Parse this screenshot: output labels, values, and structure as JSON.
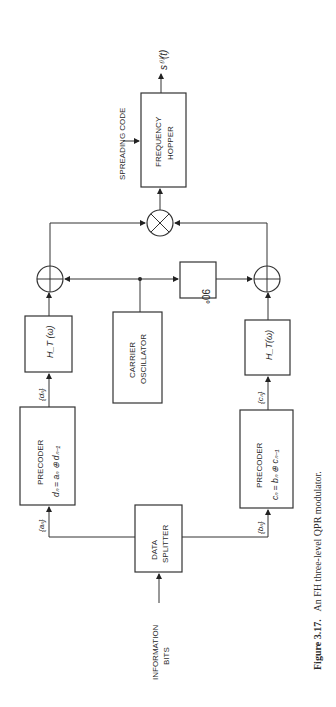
{
  "figure": {
    "caption_number": "Figure 3.17.",
    "caption_text": "An FH three-level QPR modulator."
  },
  "blocks": {
    "frequency_hopper": {
      "line1": "FREQUENCY",
      "line2": "HOPPER"
    },
    "carrier_oscillator": {
      "line1": "CARRIER",
      "line2": "OSCILLATOR"
    },
    "phase_shift": {
      "label": "90°"
    },
    "data_splitter": {
      "line1": "DATA",
      "line2": "SPLITTER"
    },
    "precoder_top": {
      "title": "PRECODER",
      "equation": "dₙ = aₙ ⊕ dₙ₋₁"
    },
    "precoder_bottom": {
      "title": "PRECODER",
      "equation": "cₙ = bₙ ⊕ cₙ₋₁"
    },
    "filter_top": {
      "label": "H_T (ω)",
      "main": "H",
      "sub": "T",
      "arg": "(ω)"
    },
    "filter_bottom": {
      "label": "H_T(ω)",
      "main": "H",
      "sub": "T",
      "arg": "(ω)"
    }
  },
  "signals": {
    "input": {
      "line1": "INFORMATION",
      "line2": "BITS"
    },
    "spreading_code": "SPREADING CODE",
    "output": "s⁽ⁱ⁾(t)",
    "a_seq": "{aₙ}",
    "b_seq": "{bₙ}",
    "d_seq": "{dₙ}",
    "c_seq": "{cₙ}"
  },
  "symbols": {
    "adder": "summing-junction",
    "multiplier": "mixer"
  }
}
